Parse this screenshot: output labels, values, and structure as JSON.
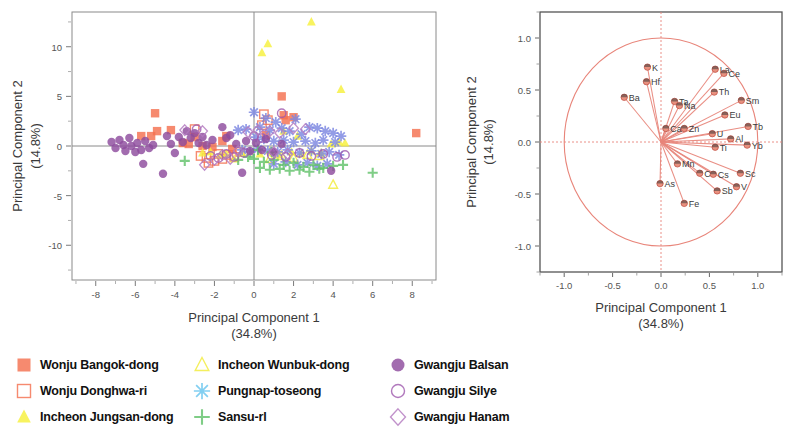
{
  "scatter": {
    "xlabel": "Principal Component 1",
    "xlabel_sub": "(34.8%)",
    "ylabel": "Principal Component 2",
    "ylabel_sub": "(14.8%)",
    "xticks": [
      "-8",
      "-6",
      "-4",
      "-2",
      "0",
      "2",
      "4",
      "6",
      "8"
    ],
    "yticks": [
      "10",
      "5",
      "0",
      "-5",
      "-10"
    ]
  },
  "loading": {
    "xlabel": "Principal Component 1",
    "xlabel_sub": "(34.8%)",
    "ylabel": "Principal Component 2",
    "ylabel_sub": "(14.8%)",
    "xticks": [
      "-1.0",
      "-0.5",
      "0.0",
      "0.5",
      "1.0"
    ],
    "yticks": [
      "1.0",
      "0.5",
      "0.0",
      "-0.5",
      "-1.0"
    ]
  },
  "legend": {
    "columns": [
      [
        {
          "label": "Wonju Bangok-dong",
          "symbol": "filled-square",
          "color": "#F4704F"
        },
        {
          "label": "Wonju Donghwa-ri",
          "symbol": "open-square",
          "color": "#F4704F"
        },
        {
          "label": "Incheon Jungsan-dong",
          "symbol": "filled-triangle",
          "color": "#F7F03C"
        }
      ],
      [
        {
          "label": "Incheon Wunbuk-dong",
          "symbol": "open-triangle",
          "color": "#F2EC3A"
        },
        {
          "label": "Pungnap-toseong",
          "symbol": "asterisk",
          "color": "#67C4EE"
        },
        {
          "label": "Sansu-rl",
          "symbol": "plus",
          "color": "#63C26B"
        }
      ],
      [
        {
          "label": "Gwangju Balsan",
          "symbol": "filled-circle",
          "color": "#8E4C9E"
        },
        {
          "label": "Gwangju Silye",
          "symbol": "open-circle",
          "color": "#A05BAE"
        },
        {
          "label": "Gwangju Hanam",
          "symbol": "open-diamond",
          "color": "#B37AC0"
        }
      ]
    ]
  },
  "chart_data": [
    {
      "type": "scatter",
      "title": "",
      "xlabel": "Principal Component 1 (34.8%)",
      "ylabel": "Principal Component 2 (14.8%)",
      "xlim": [
        -9.2,
        9.2
      ],
      "ylim": [
        -13.5,
        13.5
      ],
      "grid": false,
      "legend_position": "below",
      "reference_lines": {
        "x": 0,
        "y": 0
      },
      "series": [
        {
          "name": "Wonju Bangok-dong",
          "symbol": "filled-square",
          "color": "#F4704F",
          "points": [
            [
              -5.0,
              3.3
            ],
            [
              -5.7,
              1.0
            ],
            [
              -5.2,
              1.0
            ],
            [
              -4.9,
              1.5
            ],
            [
              -4.2,
              1.6
            ],
            [
              -3.6,
              0.3
            ],
            [
              -3.3,
              0.2
            ],
            [
              -3.0,
              0.9
            ],
            [
              -2.6,
              0.0
            ],
            [
              -2.1,
              -0.1
            ],
            [
              -1.6,
              0.5
            ],
            [
              -1.4,
              1.0
            ],
            [
              -1.1,
              -0.3
            ],
            [
              1.4,
              5.0
            ],
            [
              1.5,
              3.1
            ],
            [
              2.0,
              2.9
            ],
            [
              1.6,
              2.6
            ],
            [
              0.6,
              1.1
            ],
            [
              8.2,
              1.3
            ]
          ]
        },
        {
          "name": "Wonju Donghwa-ri",
          "symbol": "open-square",
          "color": "#F4704F",
          "points": [
            [
              -3.0,
              1.7
            ],
            [
              -2.7,
              -1.0
            ],
            [
              -2.4,
              -1.2
            ],
            [
              -2.3,
              -1.7
            ],
            [
              -2.0,
              -1.5
            ],
            [
              -1.8,
              -0.8
            ],
            [
              -1.6,
              -1.3
            ],
            [
              -1.3,
              -0.9
            ],
            [
              -1.0,
              -1.1
            ],
            [
              -0.7,
              -0.6
            ],
            [
              0.5,
              3.2
            ],
            [
              0.7,
              2.6
            ],
            [
              0.4,
              2.1
            ]
          ]
        },
        {
          "name": "Incheon Jungsan-dong",
          "symbol": "filled-triangle",
          "color": "#F7F03C",
          "points": [
            [
              0.4,
              9.4
            ],
            [
              0.7,
              10.3
            ],
            [
              2.9,
              12.5
            ],
            [
              4.4,
              5.7
            ],
            [
              -2.6,
              -0.7
            ],
            [
              -2.2,
              -0.6
            ],
            [
              -1.7,
              -0.9
            ],
            [
              -1.4,
              -0.8
            ],
            [
              -1.0,
              -1.3
            ],
            [
              -0.6,
              -0.7
            ],
            [
              -0.2,
              -0.6
            ],
            [
              0.3,
              -0.8
            ],
            [
              0.8,
              -0.5
            ],
            [
              1.3,
              -0.9
            ],
            [
              1.9,
              -0.6
            ],
            [
              2.4,
              -0.8
            ],
            [
              2.9,
              -0.5
            ],
            [
              3.4,
              -0.7
            ],
            [
              3.9,
              0.2
            ],
            [
              4.3,
              0.4
            ],
            [
              4.6,
              0.3
            ],
            [
              1.5,
              1.5
            ],
            [
              2.2,
              1.0
            ]
          ]
        },
        {
          "name": "Incheon Wunbuk-dong",
          "symbol": "open-triangle",
          "color": "#F2EC3A",
          "points": [
            [
              4.0,
              -3.9
            ],
            [
              3.3,
              -1.0
            ],
            [
              2.7,
              -0.9
            ],
            [
              2.0,
              -1.2
            ],
            [
              1.4,
              -1.0
            ],
            [
              0.8,
              -1.3
            ]
          ]
        },
        {
          "name": "Pungnap-toseong",
          "symbol": "asterisk",
          "color": "#7B86E0",
          "points": [
            [
              0.0,
              3.4
            ],
            [
              0.6,
              2.8
            ],
            [
              1.1,
              2.4
            ],
            [
              2.1,
              2.7
            ],
            [
              2.8,
              1.9
            ],
            [
              3.2,
              1.8
            ],
            [
              3.6,
              1.5
            ],
            [
              4.0,
              1.3
            ],
            [
              4.4,
              1.0
            ],
            [
              0.3,
              1.9
            ],
            [
              0.8,
              1.6
            ],
            [
              1.4,
              1.8
            ],
            [
              1.8,
              1.5
            ],
            [
              2.4,
              1.2
            ],
            [
              -0.4,
              1.7
            ],
            [
              -0.8,
              1.6
            ],
            [
              0.1,
              0.9
            ],
            [
              0.5,
              0.7
            ],
            [
              1.0,
              0.5
            ],
            [
              1.5,
              0.6
            ],
            [
              2.0,
              0.4
            ],
            [
              2.6,
              0.5
            ],
            [
              3.1,
              0.3
            ],
            [
              3.5,
              0.6
            ],
            [
              4.1,
              0.4
            ],
            [
              0.2,
              -0.3
            ],
            [
              0.7,
              -0.5
            ],
            [
              1.2,
              -0.6
            ],
            [
              1.7,
              -0.4
            ],
            [
              2.3,
              -0.7
            ],
            [
              2.9,
              -0.5
            ],
            [
              3.4,
              -0.8
            ],
            [
              3.8,
              -0.6
            ],
            [
              4.3,
              -0.9
            ],
            [
              -0.2,
              -0.6
            ],
            [
              -0.6,
              -0.4
            ],
            [
              1.0,
              -1.8
            ],
            [
              1.6,
              -1.6
            ],
            [
              2.2,
              -1.9
            ],
            [
              2.7,
              -1.7
            ],
            [
              3.2,
              -2.0
            ],
            [
              3.7,
              -1.8
            ]
          ]
        },
        {
          "name": "Sansu-rl",
          "symbol": "plus",
          "color": "#63C26B",
          "points": [
            [
              -3.5,
              -1.5
            ],
            [
              0.0,
              -1.3
            ],
            [
              0.5,
              -1.6
            ],
            [
              1.0,
              -1.4
            ],
            [
              1.5,
              -1.9
            ],
            [
              2.0,
              -1.7
            ],
            [
              2.5,
              -2.1
            ],
            [
              3.0,
              -1.9
            ],
            [
              3.5,
              -2.2
            ],
            [
              4.0,
              -2.0
            ],
            [
              4.5,
              -1.9
            ],
            [
              6.0,
              -2.7
            ],
            [
              0.3,
              -2.2
            ],
            [
              0.8,
              -2.4
            ],
            [
              1.3,
              -2.3
            ],
            [
              1.8,
              -2.5
            ],
            [
              2.3,
              -2.4
            ],
            [
              2.8,
              -2.6
            ],
            [
              3.3,
              -2.3
            ],
            [
              -0.3,
              -1.1
            ],
            [
              -0.8,
              -1.4
            ],
            [
              0.2,
              -0.4
            ],
            [
              0.9,
              -0.6
            ]
          ]
        },
        {
          "name": "Gwangju Balsan",
          "symbol": "filled-circle",
          "color": "#8E4C9E",
          "points": [
            [
              -7.2,
              0.4
            ],
            [
              -7.0,
              -0.2
            ],
            [
              -6.8,
              0.6
            ],
            [
              -6.6,
              0.1
            ],
            [
              -6.5,
              -0.5
            ],
            [
              -6.3,
              0.8
            ],
            [
              -6.2,
              0.0
            ],
            [
              -6.0,
              -0.6
            ],
            [
              -5.9,
              0.3
            ],
            [
              -5.7,
              -0.4
            ],
            [
              -5.6,
              -1.8
            ],
            [
              -5.5,
              0.5
            ],
            [
              -5.3,
              -0.2
            ],
            [
              -5.1,
              0.1
            ],
            [
              -4.6,
              -2.8
            ],
            [
              -4.4,
              1.0
            ],
            [
              -4.2,
              0.2
            ],
            [
              -4.0,
              -0.7
            ],
            [
              -3.8,
              0.9
            ],
            [
              -3.6,
              0.4
            ],
            [
              -3.4,
              1.5
            ],
            [
              -3.2,
              0.8
            ],
            [
              -3.0,
              1.3
            ],
            [
              -2.8,
              0.3
            ],
            [
              -2.6,
              0.9
            ],
            [
              -2.4,
              0.1
            ],
            [
              -2.1,
              0.6
            ],
            [
              -1.6,
              1.9
            ],
            [
              -1.4,
              0.8
            ],
            [
              -1.2,
              1.1
            ],
            [
              -0.9,
              0.2
            ],
            [
              -0.6,
              -2.7
            ],
            [
              -0.4,
              0.5
            ],
            [
              -0.2,
              -0.5
            ],
            [
              0.1,
              0.3
            ],
            [
              0.4,
              -0.4
            ],
            [
              0.6,
              0.7
            ],
            [
              1.0,
              -0.6
            ],
            [
              1.4,
              0.2
            ],
            [
              3.9,
              -2.5
            ]
          ]
        },
        {
          "name": "Gwangju Silye",
          "symbol": "open-circle",
          "color": "#A05BAE",
          "points": [
            [
              1.4,
              3.3
            ],
            [
              -2.9,
              1.7
            ],
            [
              -2.2,
              -1.0
            ],
            [
              -1.8,
              -1.2
            ],
            [
              -1.4,
              -0.8
            ],
            [
              -1.0,
              -1.1
            ],
            [
              -0.5,
              -0.7
            ],
            [
              0.0,
              1.0
            ],
            [
              0.4,
              0.8
            ],
            [
              0.9,
              -0.9
            ],
            [
              1.6,
              -1.1
            ],
            [
              2.3,
              -0.7
            ],
            [
              2.9,
              -1.0
            ],
            [
              3.5,
              -0.8
            ],
            [
              4.2,
              -1.1
            ],
            [
              4.6,
              -0.9
            ]
          ]
        },
        {
          "name": "Gwangju Hanam",
          "symbol": "open-diamond",
          "color": "#B37AC0",
          "points": [
            [
              -3.5,
              1.6
            ],
            [
              -2.6,
              1.5
            ],
            [
              -2.5,
              -1.9
            ],
            [
              -2.0,
              -1.4
            ],
            [
              -1.6,
              -0.9
            ],
            [
              -1.2,
              -1.3
            ],
            [
              -0.8,
              -0.5
            ],
            [
              -0.3,
              1.4
            ],
            [
              0.2,
              1.6
            ],
            [
              0.8,
              1.5
            ],
            [
              1.3,
              1.3
            ],
            [
              2.0,
              1.8
            ],
            [
              2.6,
              1.7
            ],
            [
              1.0,
              -0.6
            ],
            [
              1.7,
              -0.8
            ]
          ]
        }
      ]
    },
    {
      "type": "scatter",
      "subtype": "pca-loading-plot",
      "title": "",
      "xlabel": "Principal Component 1 (34.8%)",
      "ylabel": "Principal Component 2 (14.8%)",
      "xlim": [
        -1.25,
        1.25
      ],
      "ylim": [
        -1.25,
        1.25
      ],
      "grid": false,
      "unit_circle": true,
      "reference_lines": {
        "x": 0,
        "y": 0
      },
      "vector_color": "#E8857A",
      "loadings": [
        {
          "label": "K",
          "x": -0.14,
          "y": 0.72
        },
        {
          "label": "Hf",
          "x": -0.15,
          "y": 0.58
        },
        {
          "label": "Ba",
          "x": -0.38,
          "y": 0.43
        },
        {
          "label": "Ta",
          "x": 0.14,
          "y": 0.39
        },
        {
          "label": "Na",
          "x": 0.19,
          "y": 0.35
        },
        {
          "label": "La",
          "x": 0.56,
          "y": 0.7
        },
        {
          "label": "Ce",
          "x": 0.65,
          "y": 0.66
        },
        {
          "label": "Th",
          "x": 0.55,
          "y": 0.48
        },
        {
          "label": "Sm",
          "x": 0.83,
          "y": 0.4
        },
        {
          "label": "Eu",
          "x": 0.66,
          "y": 0.26
        },
        {
          "label": "Tb",
          "x": 0.9,
          "y": 0.15
        },
        {
          "label": "Ca",
          "x": 0.05,
          "y": 0.13
        },
        {
          "label": "Zn",
          "x": 0.24,
          "y": 0.13
        },
        {
          "label": "U",
          "x": 0.53,
          "y": 0.08
        },
        {
          "label": "Al",
          "x": 0.72,
          "y": 0.03
        },
        {
          "label": "Yb",
          "x": 0.89,
          "y": -0.03
        },
        {
          "label": "Ti",
          "x": 0.56,
          "y": -0.05
        },
        {
          "label": "Mn",
          "x": 0.17,
          "y": -0.21
        },
        {
          "label": "Cr",
          "x": 0.4,
          "y": -0.3
        },
        {
          "label": "Cs",
          "x": 0.54,
          "y": -0.31
        },
        {
          "label": "Sc",
          "x": 0.82,
          "y": -0.3
        },
        {
          "label": "V",
          "x": 0.78,
          "y": -0.43
        },
        {
          "label": "As",
          "x": -0.01,
          "y": -0.4
        },
        {
          "label": "Sb",
          "x": 0.58,
          "y": -0.47
        },
        {
          "label": "Fe",
          "x": 0.24,
          "y": -0.59
        }
      ]
    }
  ]
}
